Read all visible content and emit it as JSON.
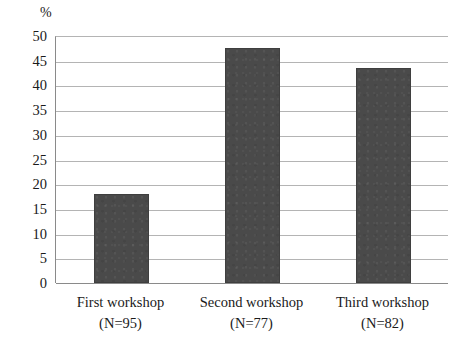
{
  "chart_data": {
    "type": "bar",
    "title": "",
    "subtitle": "",
    "xlabel": "",
    "ylabel": "%",
    "ylim": [
      0,
      50
    ],
    "ytick_step": 5,
    "yticks": [
      50,
      45,
      40,
      35,
      30,
      25,
      20,
      15,
      10,
      5,
      0
    ],
    "grid": true,
    "legend": "none",
    "categories": [
      "First workshop",
      "Second workshop",
      "Third workshop"
    ],
    "category_sublabels": [
      "(N=95)",
      "(N=77)",
      "(N=82)"
    ],
    "sample_sizes": [
      95,
      77,
      82
    ],
    "values": [
      18,
      47.5,
      43.5
    ],
    "series": [
      {
        "name": "percent",
        "values": [
          18,
          47.5,
          43.5
        ]
      }
    ],
    "bar_color": "#4a4a4a",
    "gridline_color": "#b4b4b4",
    "axis_color": "#8a8a8a",
    "background_color": "#ffffff"
  }
}
